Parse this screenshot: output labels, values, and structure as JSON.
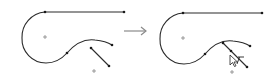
{
  "diagram": {
    "panels": [
      {
        "id": "before",
        "label": ""
      },
      {
        "id": "after",
        "label": ""
      }
    ],
    "arrow": {
      "direction": "right"
    },
    "icons": {
      "cursor": "trim-cursor-icon",
      "arrow": "right-arrow-icon"
    },
    "colors": {
      "stroke": "#2b2b2b",
      "arrow": "#8a8a8a",
      "background": "#ffffff"
    }
  }
}
